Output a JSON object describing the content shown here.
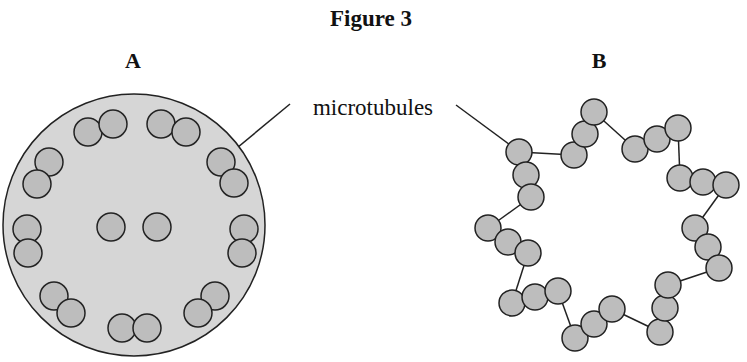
{
  "figure": {
    "title": "Figure 3",
    "panels": [
      {
        "label": "A",
        "description": "cross-section with 9 peripheral doublets and central pair of microtubules"
      },
      {
        "label": "B",
        "description": "9 triplets of microtubules connected by linkers"
      }
    ],
    "annotation": "microtubules"
  },
  "colors": {
    "fill": "#bdbdbd",
    "cell_fill": "#d4d4d4",
    "stroke": "#222222"
  }
}
